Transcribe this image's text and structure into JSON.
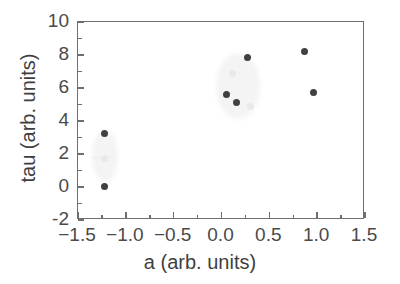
{
  "chart_data": {
    "type": "scatter",
    "title": "",
    "xlabel": "a (arb. units)",
    "ylabel": "tau (arb. units)",
    "xlim": [
      -1.5,
      1.5
    ],
    "ylim": [
      -2,
      10
    ],
    "xticks": [
      "-1.5",
      "-1.0",
      "-0.5",
      "0.0",
      "0.5",
      "1.0",
      "1.5"
    ],
    "xtick_values": [
      -1.5,
      -1.0,
      -0.5,
      0.0,
      0.5,
      1.0,
      1.5
    ],
    "yticks": [
      "10",
      "8",
      "6",
      "4",
      "2",
      "0",
      "-2"
    ],
    "ytick_values": [
      10,
      8,
      6,
      4,
      2,
      0,
      -2
    ],
    "grid": false,
    "legend": null,
    "marker_color": "#404040",
    "faint_marker_color": "#e9e9e9",
    "axis_color": "#6e6e6e",
    "background": "#ffffff",
    "series": [
      {
        "name": "tau vs a",
        "points": [
          {
            "x": -1.22,
            "y": 3.25,
            "style": "solid"
          },
          {
            "x": -1.22,
            "y": 0.05,
            "style": "solid"
          },
          {
            "x": 0.05,
            "y": 5.6,
            "style": "solid"
          },
          {
            "x": 0.16,
            "y": 5.1,
            "style": "solid"
          },
          {
            "x": 0.27,
            "y": 7.85,
            "style": "solid"
          },
          {
            "x": 0.87,
            "y": 8.2,
            "style": "solid"
          },
          {
            "x": 0.96,
            "y": 5.7,
            "style": "solid"
          }
        ]
      },
      {
        "name": "faded artifacts",
        "points": [
          {
            "x": -1.22,
            "y": 1.75,
            "style": "faint"
          },
          {
            "x": 0.12,
            "y": 6.9,
            "style": "faint"
          },
          {
            "x": 0.3,
            "y": 4.9,
            "style": "faint"
          }
        ]
      }
    ]
  },
  "axes": {
    "x_title": "a (arb. units)",
    "y_title": "tau (arb. units)"
  }
}
